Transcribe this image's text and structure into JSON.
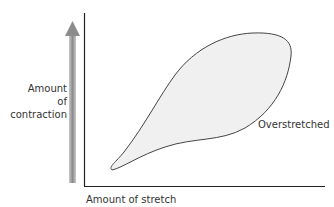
{
  "diagram": {
    "y_label_line1": "Amount of",
    "y_label_line2": "contraction",
    "x_label": "Amount of stretch",
    "region_label": "Overstretched",
    "colors": {
      "axis": "#222222",
      "blob_fill": "#f0f0f0",
      "blob_stroke": "#444444",
      "arrow": "#999999"
    }
  }
}
